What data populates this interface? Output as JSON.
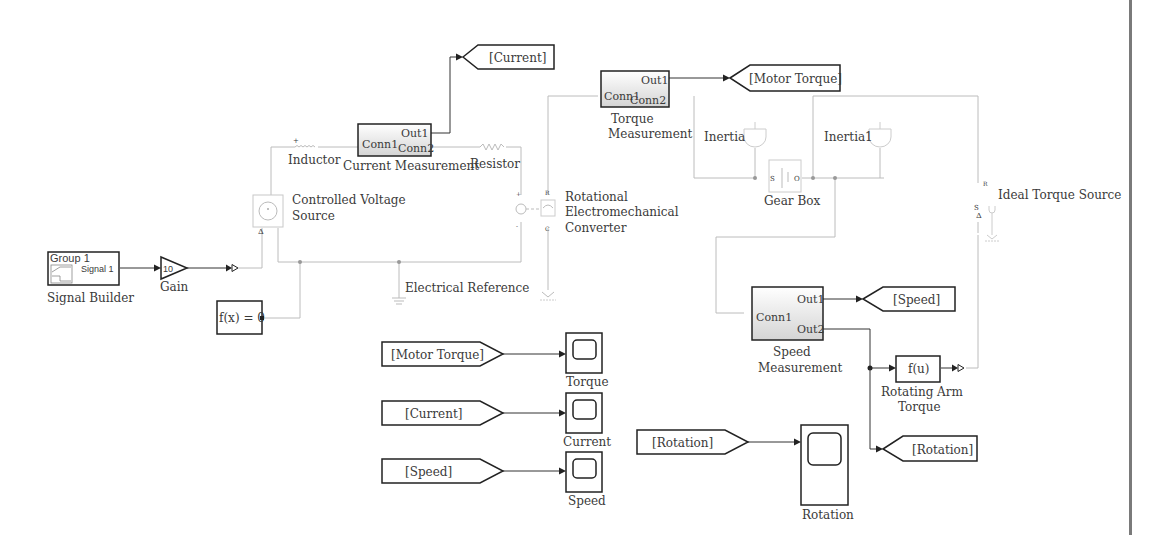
{
  "diagram": {
    "colors": {
      "signal_wire": "#333333",
      "physical_wire": "#bcbcbc",
      "block_border": "#222222",
      "subsystem_gradient_top": "#ffffff",
      "subsystem_gradient_bottom": "#d6d6d6",
      "edge_bar": "#7a7a7a"
    },
    "blocks": {
      "signal_builder": {
        "group": "Group 1",
        "signal": "Signal 1",
        "label": "Signal Builder"
      },
      "gain": {
        "value": "10",
        "label": "Gain"
      },
      "solver": {
        "text": "f(x) = 0"
      },
      "controlled_voltage_source": {
        "label_line1": "Controlled Voltage",
        "label_line2": "Source"
      },
      "inductor": {
        "label": "Inductor"
      },
      "current_measurement": {
        "port_in": "Conn1",
        "port_out1": "Out1",
        "port_out2": "Conn2",
        "label": "Current Measurement"
      },
      "resistor": {
        "label": "Resistor"
      },
      "electrical_reference": {
        "label": "Electrical Reference"
      },
      "rot_converter": {
        "label_line1": "Rotational",
        "label_line2": "Electromechanical",
        "label_line3": "Converter"
      },
      "torque_measurement": {
        "port_in": "Conn1",
        "port_out1": "Out1",
        "port_out2": "Conn2",
        "label_line1": "Torque",
        "label_line2": "Measurement"
      },
      "inertia": {
        "label": "Inertia"
      },
      "inertia1": {
        "label": "Inertia1"
      },
      "gear_box": {
        "label": "Gear Box",
        "port_s": "S",
        "port_o": "O"
      },
      "ideal_torque_source": {
        "label": "Ideal Torque Source"
      },
      "speed_measurement": {
        "port_in": "Conn1",
        "port_out1": "Out1",
        "port_out2": "Out2",
        "label_line1": "Speed",
        "label_line2": "Measurement"
      },
      "fcn": {
        "text": "f(u)",
        "label_line1": "Rotating Arm",
        "label_line2": "Torque"
      }
    },
    "goto_tags": [
      {
        "id": "goto-current",
        "text": "[Current]"
      },
      {
        "id": "goto-motor-torque",
        "text": "[Motor Torque]"
      },
      {
        "id": "goto-speed",
        "text": "[Speed]"
      },
      {
        "id": "goto-rotation",
        "text": "[Rotation]"
      }
    ],
    "from_tags": [
      {
        "id": "from-motor-torque",
        "text": "[Motor Torque]"
      },
      {
        "id": "from-current",
        "text": "[Current]"
      },
      {
        "id": "from-speed",
        "text": "[Speed]"
      },
      {
        "id": "from-rotation",
        "text": "[Rotation]"
      }
    ],
    "scopes": [
      {
        "id": "scope-torque",
        "label": "Torque"
      },
      {
        "id": "scope-current",
        "label": "Current"
      },
      {
        "id": "scope-speed",
        "label": "Speed"
      },
      {
        "id": "scope-rotation",
        "label": "Rotation"
      }
    ]
  }
}
